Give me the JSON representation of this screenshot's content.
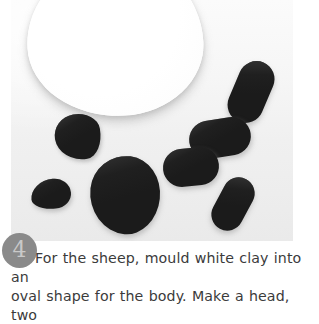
{
  "photo": {
    "alt_name": "clay-modelling-step-photo",
    "background_color": "#f1f1f1",
    "pieces": [
      {
        "name": "white-clay-body",
        "color": "#ffffff",
        "shape": "oval"
      },
      {
        "name": "dark-clay-head",
        "color": "#1b1b1b",
        "shape": "irregular-lump"
      },
      {
        "name": "dark-clay-blob",
        "color": "#1b1b1b",
        "shape": "large-irregular-lump"
      },
      {
        "name": "dark-clay-ear",
        "color": "#1b1b1b",
        "shape": "small-lump"
      },
      {
        "name": "dark-clay-leg-1",
        "color": "#1b1b1b",
        "shape": "capsule"
      },
      {
        "name": "dark-clay-leg-2",
        "color": "#1b1b1b",
        "shape": "capsule"
      },
      {
        "name": "dark-clay-leg-3",
        "color": "#1b1b1b",
        "shape": "capsule"
      },
      {
        "name": "dark-clay-leg-4",
        "color": "#1b1b1b",
        "shape": "capsule"
      }
    ]
  },
  "step": {
    "number": "4",
    "badge_color": "#8a8a8a",
    "number_color": "#c9c9c9"
  },
  "caption": {
    "line1": "For the sheep, mould white clay into an",
    "line2": "oval shape for the body. Make a head, two",
    "text_color": "#3b3b3b"
  }
}
